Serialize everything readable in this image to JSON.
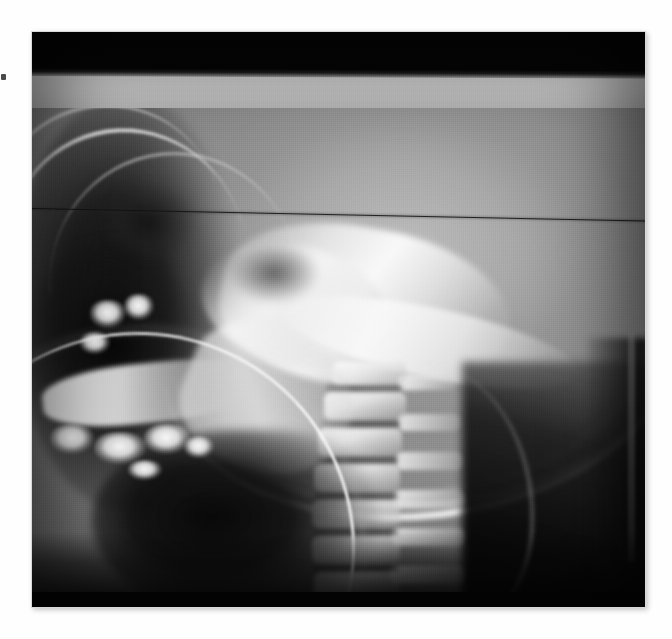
{
  "document": {
    "kind": "radiograph",
    "modality": "X-ray",
    "view": "lateral cephalometric / cervical spine",
    "page_background": "#ffffff",
    "visible_text": []
  },
  "plate": {
    "name": "radiograph-film",
    "x": 32,
    "y": 32,
    "width": 613,
    "height": 575,
    "base_color": "#0b0b0b"
  },
  "artifacts": {
    "top_collimation_band": {
      "label": "black band",
      "color": "#050505",
      "y": 0,
      "height": 40
    },
    "scan_line": {
      "label": "horizontal scan artifact line",
      "color": "#121212",
      "y_left": 176,
      "slope_deg": 1.15
    },
    "edge_speck": {
      "label": "speck on page margin",
      "color": "#2a2a2a",
      "x": 1,
      "y": 74
    },
    "bright_arc": {
      "label": "dental appliance / collimator arc",
      "color": "#fafafa"
    },
    "right_film_edge": {
      "label": "cassette edge strip",
      "color": "#969696"
    }
  },
  "anatomy": {
    "regions": [
      {
        "id": "cranial-vault",
        "label": "cranial vault soft tissue",
        "tone": "#bebebe"
      },
      {
        "id": "frontal-ridge",
        "label": "frontal bone / nasion ridge",
        "tone": "#e1e1e1"
      },
      {
        "id": "orbit",
        "label": "orbit / maxillary sinus air",
        "tone": "#121212"
      },
      {
        "id": "skull-base",
        "label": "skull base / petrous ridge",
        "tone": "#fcfcfc"
      },
      {
        "id": "sella-turcica",
        "label": "sella turcica",
        "tone": "#282828"
      },
      {
        "id": "clivus",
        "label": "clivus",
        "tone": "#fafafa"
      },
      {
        "id": "occipital-bone",
        "label": "occipital bone outer table",
        "tone": "#ffffff"
      },
      {
        "id": "mandible",
        "label": "mandible body and ramus",
        "tone": "#f2f2f2"
      },
      {
        "id": "dentition",
        "label": "teeth / dental fillings",
        "tone": "#ffffff"
      },
      {
        "id": "airway",
        "label": "oropharyngeal airway",
        "tone": "#040404"
      },
      {
        "id": "posterior-neck",
        "label": "posterior neck soft tissue",
        "tone": "#0a0a0a"
      }
    ],
    "vertebrae": [
      {
        "label": "C1",
        "x": 300,
        "y": 330,
        "w": 74,
        "h": 22
      },
      {
        "label": "C2",
        "x": 292,
        "y": 360,
        "w": 82,
        "h": 28
      },
      {
        "label": "C3",
        "x": 286,
        "y": 396,
        "w": 84,
        "h": 28
      },
      {
        "label": "C4",
        "x": 282,
        "y": 432,
        "w": 86,
        "h": 28
      },
      {
        "label": "C5",
        "x": 280,
        "y": 468,
        "w": 88,
        "h": 28
      },
      {
        "label": "C6",
        "x": 280,
        "y": 504,
        "w": 88,
        "h": 28
      },
      {
        "label": "C7",
        "x": 282,
        "y": 540,
        "w": 86,
        "h": 26
      }
    ],
    "disc_spaces": [
      {
        "x": 294,
        "y": 352,
        "w": 76,
        "h": 9
      },
      {
        "x": 288,
        "y": 388,
        "w": 80,
        "h": 9
      },
      {
        "x": 284,
        "y": 424,
        "w": 82,
        "h": 9
      },
      {
        "x": 282,
        "y": 460,
        "w": 84,
        "h": 9
      },
      {
        "x": 281,
        "y": 496,
        "w": 85,
        "h": 9
      },
      {
        "x": 281,
        "y": 532,
        "w": 85,
        "h": 9
      }
    ],
    "spinous_processes": [
      {
        "x": 366,
        "y": 342,
        "w": 58,
        "h": 16
      },
      {
        "x": 366,
        "y": 382,
        "w": 62,
        "h": 17
      },
      {
        "x": 364,
        "y": 420,
        "w": 66,
        "h": 18
      },
      {
        "x": 362,
        "y": 458,
        "w": 70,
        "h": 18
      },
      {
        "x": 360,
        "y": 496,
        "w": 72,
        "h": 18
      },
      {
        "x": 358,
        "y": 534,
        "w": 74,
        "h": 18
      }
    ],
    "teeth": [
      {
        "x": 58,
        "y": 268,
        "w": 36,
        "h": 28
      },
      {
        "x": 92,
        "y": 262,
        "w": 30,
        "h": 26
      },
      {
        "x": 48,
        "y": 300,
        "w": 30,
        "h": 22
      },
      {
        "x": 18,
        "y": 392,
        "w": 44,
        "h": 30
      },
      {
        "x": 62,
        "y": 400,
        "w": 52,
        "h": 32
      },
      {
        "x": 112,
        "y": 392,
        "w": 46,
        "h": 30
      },
      {
        "x": 152,
        "y": 404,
        "w": 30,
        "h": 22
      },
      {
        "x": 96,
        "y": 428,
        "w": 34,
        "h": 20
      }
    ]
  }
}
